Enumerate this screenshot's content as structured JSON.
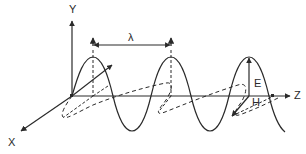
{
  "diagram": {
    "type": "electromagnetic-wave",
    "labels": {
      "y_axis": "Y",
      "x_axis": "X",
      "z_axis": "Z",
      "wavelength": "λ",
      "electric_field": "E",
      "magnetic_field": "H"
    },
    "colors": {
      "line": "#2a2a2a",
      "background": "#ffffff"
    }
  }
}
